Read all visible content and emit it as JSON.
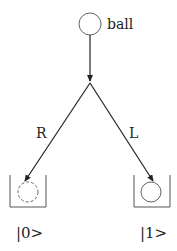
{
  "diagram": {
    "title": "",
    "source_node": {
      "label": "ball"
    },
    "branches": [
      {
        "label": "R",
        "target_state": "|0>",
        "ball_style": "dashed"
      },
      {
        "label": "L",
        "target_state": "|1>",
        "ball_style": "solid"
      }
    ],
    "colors": {
      "stroke": "#333333",
      "circle": "#666666"
    }
  }
}
